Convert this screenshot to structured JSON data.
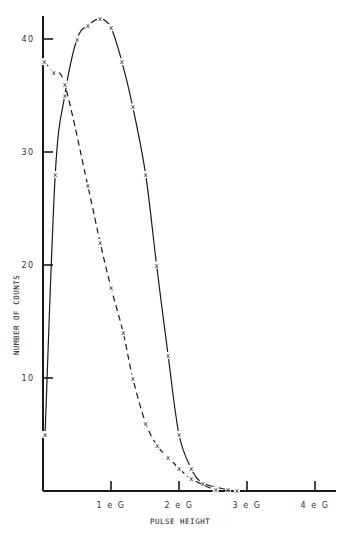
{
  "chart_data": {
    "type": "line",
    "title": "",
    "xlabel": "PULSE HEIGHT",
    "ylabel": "NUMBER OF COUNTS",
    "xlim": [
      0,
      4.2
    ],
    "ylim": [
      0,
      43
    ],
    "x_ticks": [
      {
        "value": 1,
        "label": "1 e G"
      },
      {
        "value": 2,
        "label": "2 e G"
      },
      {
        "value": 3,
        "label": "3 e G"
      },
      {
        "value": 4,
        "label": "4 e G"
      }
    ],
    "y_ticks": [
      {
        "value": 10,
        "label": "10"
      },
      {
        "value": 20,
        "label": "20"
      },
      {
        "value": 30,
        "label": "30"
      },
      {
        "value": 40,
        "label": "40"
      }
    ],
    "grid": false,
    "legend": null,
    "marker": "x",
    "series": [
      {
        "name": "solid",
        "line_style": "solid",
        "x": [
          0.03,
          0.18,
          0.32,
          0.5,
          0.66,
          0.84,
          1.0,
          1.16,
          1.32,
          1.51,
          1.67,
          1.84,
          2.0,
          2.18,
          2.35,
          2.72
        ],
        "y": [
          5,
          28,
          35,
          40,
          41.2,
          41.8,
          41,
          38,
          34,
          28,
          20,
          12,
          5,
          2,
          0.7,
          0.1
        ]
      },
      {
        "name": "dashed",
        "line_style": "dashed",
        "x": [
          0.02,
          0.16,
          0.32,
          0.66,
          0.84,
          1.0,
          1.18,
          1.32,
          1.51,
          1.68,
          1.84,
          2.0,
          2.18,
          2.54,
          2.85
        ],
        "y": [
          38,
          37,
          36,
          27,
          22,
          18,
          14,
          10,
          6,
          4,
          3,
          2,
          1.1,
          0.1,
          0
        ]
      }
    ]
  },
  "axes": {
    "x_title": "PULSE HEIGHT",
    "y_title": "NUMBER OF COUNTS",
    "y_tick_labels": [
      "10",
      "20",
      "30",
      "40"
    ],
    "x_tick_labels": [
      "1 e G",
      "2 e G",
      "3 e G",
      "4 e G"
    ]
  },
  "colors": {
    "ink": "#1a1a1a",
    "background": "#ffffff"
  }
}
